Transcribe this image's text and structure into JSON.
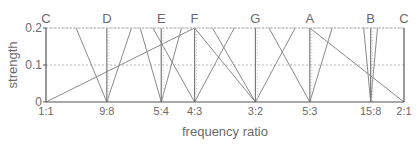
{
  "chart_data": {
    "type": "line",
    "title": "",
    "xlabel": "frequency ratio",
    "ylabel": "strength",
    "ylim": [
      0,
      0.2
    ],
    "xscale": "log2",
    "grid": "dotted at y=0.1 and y=0.2",
    "yticks": [
      {
        "value": 0,
        "label": "0"
      },
      {
        "value": 0.1,
        "label": "0.1"
      },
      {
        "value": 0.2,
        "label": "0.2"
      }
    ],
    "categories": [
      "1:1",
      "9:8",
      "5:4",
      "4:3",
      "3:2",
      "5:3",
      "15:8",
      "2:1"
    ],
    "ratios": [
      1,
      1.125,
      1.25,
      1.3333,
      1.5,
      1.6667,
      1.875,
      2
    ],
    "note_labels": [
      {
        "note": "C",
        "ratio": 1
      },
      {
        "note": "D",
        "ratio": 1.125
      },
      {
        "note": "E",
        "ratio": 1.25
      },
      {
        "note": "F",
        "ratio": 1.3333
      },
      {
        "note": "G",
        "ratio": 1.5
      },
      {
        "note": "A",
        "ratio": 1.6667
      },
      {
        "note": "B",
        "ratio": 1.875
      },
      {
        "note": "C",
        "ratio": 2
      }
    ],
    "series": [
      {
        "name": "1:1 rising line",
        "points": [
          [
            1,
            0
          ],
          [
            1.3333,
            0.2
          ]
        ]
      },
      {
        "name": "2:1 falling line",
        "points": [
          [
            1.6667,
            0.2
          ],
          [
            2,
            0
          ]
        ]
      },
      {
        "name": "9:8 V",
        "points": [
          [
            1.06,
            0.2
          ],
          [
            1.125,
            0
          ],
          [
            1.18,
            0.2
          ]
        ]
      },
      {
        "name": "5:4 V",
        "points": [
          [
            1.2,
            0.2
          ],
          [
            1.25,
            0
          ],
          [
            1.3,
            0.2
          ]
        ]
      },
      {
        "name": "4:3 V",
        "points": [
          [
            1.23,
            0.2
          ],
          [
            1.3333,
            0
          ],
          [
            1.44,
            0.2
          ]
        ]
      },
      {
        "name": "4:3 falling",
        "points": [
          [
            1.3333,
            0.2
          ],
          [
            1.5,
            0
          ]
        ]
      },
      {
        "name": "3:2 V",
        "points": [
          [
            1.38,
            0.2
          ],
          [
            1.5,
            0
          ],
          [
            1.62,
            0.2
          ]
        ]
      },
      {
        "name": "5:3 V",
        "points": [
          [
            1.54,
            0.2
          ],
          [
            1.6667,
            0
          ],
          [
            1.74,
            0.2
          ]
        ]
      },
      {
        "name": "15:8 V",
        "points": [
          [
            1.85,
            0.2
          ],
          [
            1.875,
            0
          ],
          [
            1.9,
            0.2
          ]
        ]
      }
    ],
    "vertical_markers": [
      1,
      1.125,
      1.25,
      1.3333,
      1.5,
      1.6667,
      1.875,
      2
    ],
    "legend": "none"
  }
}
